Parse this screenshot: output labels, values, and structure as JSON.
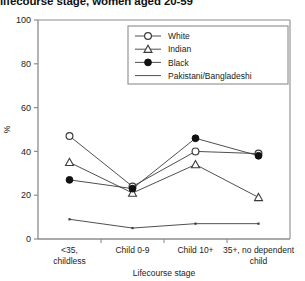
{
  "chart_data": {
    "type": "line",
    "title": "lifecourse stage, women aged 20-59",
    "xlabel": "Lifecourse stage",
    "ylabel": "%",
    "categories": [
      "<35, childless",
      "Child 0-9",
      "Child 10+",
      "35+, no dependent child"
    ],
    "category_lines": [
      [
        "<35,",
        "childless"
      ],
      [
        "Child 0-9",
        ""
      ],
      [
        "Child 10+",
        ""
      ],
      [
        "35+, no dependent",
        "child"
      ]
    ],
    "ylim": [
      0,
      100
    ],
    "yticks": [
      0,
      20,
      40,
      60,
      80,
      100
    ],
    "ytick_labels": [
      "0",
      "20",
      "40",
      "60",
      "80",
      "100"
    ],
    "grid": false,
    "legend_position": "top-right",
    "series": [
      {
        "name": "White",
        "marker": "open-circle",
        "values": [
          47,
          24,
          40,
          39
        ]
      },
      {
        "name": "Indian",
        "marker": "open-triangle",
        "values": [
          35,
          21,
          34,
          19
        ]
      },
      {
        "name": "Black",
        "marker": "filled-circle",
        "values": [
          27,
          23,
          46,
          38
        ]
      },
      {
        "name": "Pakistani/Bangladeshi",
        "marker": "line-only",
        "values": [
          9,
          5,
          7,
          7
        ]
      }
    ],
    "colors": {
      "line": "#3b3b3b",
      "axis": "#8c8c8c",
      "text": "#1a1a1a"
    }
  }
}
